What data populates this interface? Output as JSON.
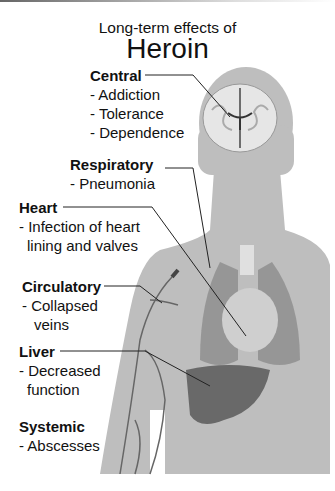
{
  "title": {
    "line1": "Long-term effects of",
    "line2": "Heroin"
  },
  "colors": {
    "silhouette": "#bebebe",
    "text": "#111111",
    "leader": "#222222"
  },
  "sections": [
    {
      "name": "Central",
      "items": [
        "- Addiction",
        "- Tolerance",
        "- Dependence"
      ]
    },
    {
      "name": "Respiratory",
      "items": [
        "- Pneumonia"
      ]
    },
    {
      "name": "Heart",
      "items": [
        "- Infection of heart",
        "lining and valves"
      ]
    },
    {
      "name": "Circulatory",
      "items": [
        "- Collapsed",
        "veins"
      ]
    },
    {
      "name": "Liver",
      "items": [
        "- Decreased",
        "function"
      ]
    },
    {
      "name": "Systemic",
      "items": [
        "- Abscesses"
      ]
    }
  ]
}
